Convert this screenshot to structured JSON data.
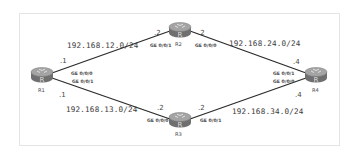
{
  "diagram": {
    "type": "network-topology",
    "routers": [
      {
        "id": "R1",
        "label": "R1"
      },
      {
        "id": "R2",
        "label": "R2"
      },
      {
        "id": "R3",
        "label": "R3"
      },
      {
        "id": "R4",
        "label": "R4"
      }
    ],
    "links": [
      {
        "from": "R1",
        "to": "R2",
        "network": "192.168.12.0/24",
        "a_if": "GE 0/0/0",
        "a_ip": ".1",
        "b_if": "GE 0/0/1",
        "b_ip": ".2"
      },
      {
        "from": "R2",
        "to": "R4",
        "network": "192.168.24.0/24",
        "a_if": "GE 0/0/0",
        "a_ip": ".2",
        "b_if": "GE 0/0/1",
        "b_ip": ".4"
      },
      {
        "from": "R1",
        "to": "R3",
        "network": "192.168.13.0/24",
        "a_if": "GE 0/0/1",
        "a_ip": ".1",
        "b_if": "GE 0/0/0",
        "b_ip": ".2"
      },
      {
        "from": "R3",
        "to": "R4",
        "network": "192.168.34.0/24",
        "a_if": "GE 0/0/1",
        "a_ip": ".2",
        "b_if": "GE 0/0/0",
        "b_ip": ".4"
      }
    ],
    "icon": "router-icon",
    "colors": {
      "link": "#2b2b2b",
      "router_top": "#9a9a9a",
      "router_body": "#6f6f6f",
      "frame": "#e4e4e4"
    }
  }
}
